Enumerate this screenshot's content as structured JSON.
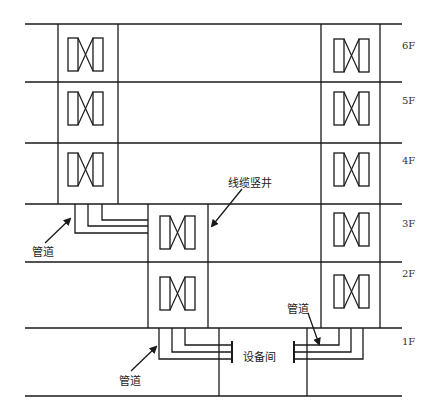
{
  "diagram": {
    "title": "",
    "floors": [
      {
        "label": "6F",
        "y_top": 24,
        "y_bottom": 82
      },
      {
        "label": "5F",
        "y_top": 82,
        "y_bottom": 143
      },
      {
        "label": "4F",
        "y_top": 143,
        "y_bottom": 204
      },
      {
        "label": "3F",
        "y_top": 204,
        "y_bottom": 262
      },
      {
        "label": "2F",
        "y_top": 262,
        "y_bottom": 328
      },
      {
        "label": "1F",
        "y_top": 328,
        "y_bottom": 396
      }
    ],
    "labels": {
      "cable_shaft": "线缆竖井",
      "conduit_upper_left": "管道",
      "conduit_lower_left": "管道",
      "conduit_right": "管道",
      "equipment_room": "设备间"
    },
    "line_color": "#1a1a1a"
  }
}
